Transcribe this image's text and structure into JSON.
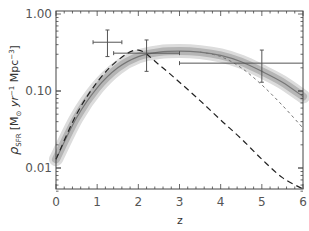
{
  "chart_data": {
    "type": "line",
    "title": "",
    "xlabel": "z",
    "ylabel_parts": {
      "rho": "ρ",
      "sub": "SFR",
      "units_open": "[M",
      "odot": "⊙",
      "yr": " yr",
      "yr_exp": "−1",
      "mpc": " Mpc",
      "mpc_exp": "−3",
      "units_close": "]"
    },
    "xlim": [
      0,
      6
    ],
    "ylim": [
      0.005,
      1.0
    ],
    "yscale": "log",
    "x_ticks": [
      0,
      1,
      2,
      3,
      4,
      5,
      6
    ],
    "x_tick_labels": [
      "0",
      "1",
      "2",
      "3",
      "4",
      "5",
      "6"
    ],
    "y_ticks": [
      0.01,
      0.1,
      1.0
    ],
    "y_tick_labels": [
      "0.01",
      "0.10",
      "1.00"
    ],
    "grid": false,
    "legend": "none",
    "series": [
      {
        "name": "model-median",
        "style": "solid-band",
        "x": [
          0,
          0.5,
          1,
          1.5,
          2,
          2.5,
          3,
          3.5,
          4,
          4.5,
          5,
          5.5,
          6
        ],
        "y": [
          0.013,
          0.045,
          0.11,
          0.2,
          0.28,
          0.32,
          0.33,
          0.32,
          0.29,
          0.24,
          0.18,
          0.13,
          0.085
        ]
      },
      {
        "name": "long-dashed",
        "style": "long-dash",
        "x": [
          0,
          0.5,
          1,
          1.5,
          2,
          2.5,
          3,
          3.5,
          4,
          4.5,
          5,
          5.5,
          6
        ],
        "y": [
          0.013,
          0.05,
          0.13,
          0.25,
          0.34,
          0.22,
          0.13,
          0.075,
          0.042,
          0.024,
          0.013,
          0.0075,
          0.0045
        ]
      },
      {
        "name": "short-dashed",
        "style": "short-dash",
        "x": [
          3.5,
          4,
          4.5,
          5,
          5.5,
          6
        ],
        "y": [
          0.32,
          0.28,
          0.2,
          0.12,
          0.065,
          0.033
        ]
      }
    ],
    "points": [
      {
        "x": 1.25,
        "y": 0.43,
        "xerr": [
          0.9,
          1.6
        ],
        "yerr": [
          0.28,
          0.62
        ]
      },
      {
        "x": 2.2,
        "y": 0.31,
        "xerr": [
          1.4,
          3.0
        ],
        "yerr": [
          0.18,
          0.46
        ]
      },
      {
        "x": 5.0,
        "y": 0.23,
        "xerr": [
          3.0,
          6.0
        ],
        "yerr": [
          0.13,
          0.34
        ]
      }
    ]
  }
}
